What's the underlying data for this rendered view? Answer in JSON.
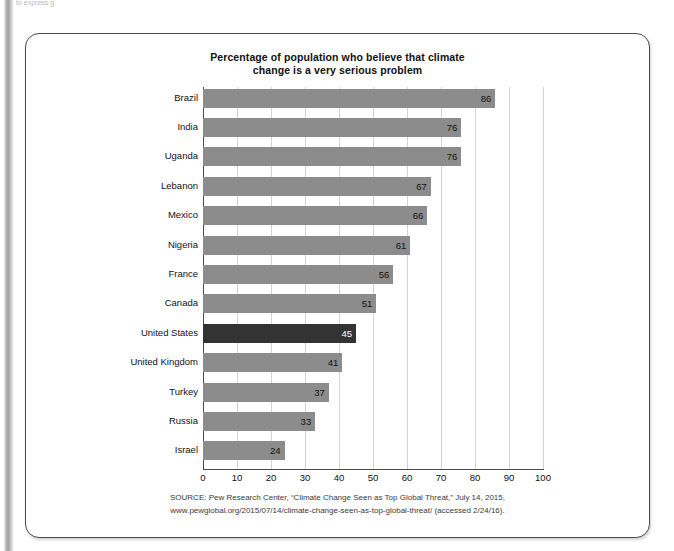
{
  "page": {
    "top_sliver_text": "to express g"
  },
  "figure": {
    "title_line1": "Percentage of population who believe that climate",
    "title_line2": "change is a very serious problem",
    "colors": {
      "bar": "#8c8c8c",
      "bar_highlight": "#333333",
      "gridline": "#d2d2d2",
      "axis": "#4a4a4a",
      "card_border": "#4a4a4a"
    },
    "source": {
      "line1": "SOURCE: Pew Research Center, “Climate Change Seen as Top Global Threat,” July 14, 2015,",
      "line2": "www.pewglobal.org/2015/07/14/climate-change-seen-as-top-global-threat/ (accessed 2/24/16)."
    }
  },
  "chart_data": {
    "type": "bar",
    "orientation": "horizontal",
    "title": "Percentage of population who believe that climate change is a very serious problem",
    "xlabel": "",
    "ylabel": "",
    "xlim": [
      0,
      100
    ],
    "xticks": [
      0,
      10,
      20,
      30,
      40,
      50,
      60,
      70,
      80,
      90,
      100
    ],
    "grid": true,
    "legend": "none",
    "highlight_category": "United States",
    "categories": [
      "Brazil",
      "India",
      "Uganda",
      "Lebanon",
      "Mexico",
      "Nigeria",
      "France",
      "Canada",
      "United States",
      "United Kingdom",
      "Turkey",
      "Russia",
      "Israel"
    ],
    "values": [
      86,
      76,
      76,
      67,
      66,
      61,
      56,
      51,
      45,
      41,
      37,
      33,
      24
    ]
  }
}
